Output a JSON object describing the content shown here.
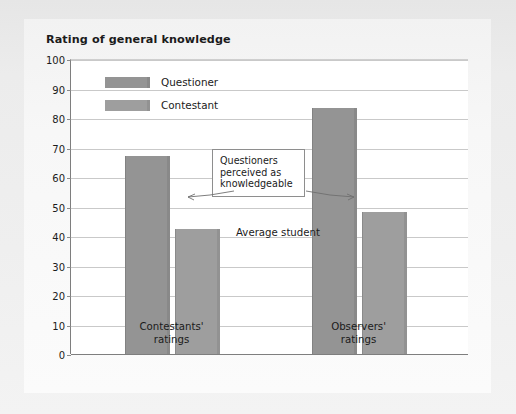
{
  "figure": {
    "title": "Rating of general knowledge",
    "annotation": "Questioners perceived as knowledgeable",
    "annotation_lines": [
      "Questioners",
      "perceived as",
      "knowledgeable"
    ],
    "average_student_label": "Average student",
    "background_color": "#e9e9e9",
    "plot_background_color": "#ffffff",
    "axis_color": "#7e7e7e",
    "gridline_color": "#c9c9c9"
  },
  "chart_data": {
    "type": "bar",
    "title": "Rating of general knowledge",
    "xlabel": "",
    "ylabel": "",
    "ylim": [
      0,
      100
    ],
    "yticks": [
      0,
      10,
      20,
      30,
      40,
      50,
      60,
      70,
      80,
      90,
      100
    ],
    "ytick_labels": [
      "0",
      "10",
      "20",
      "30",
      "40",
      "50",
      "60",
      "70",
      "80",
      "90",
      "100"
    ],
    "grid": true,
    "legend_position": "upper-left-inside",
    "categories": [
      "Contestants' ratings",
      "Observers' ratings"
    ],
    "category_lines": [
      [
        "Contestants'",
        "ratings"
      ],
      [
        "Observers'",
        "ratings"
      ]
    ],
    "series": [
      {
        "name": "Questioner",
        "color": "#949494",
        "values": [
          67,
          83.5
        ]
      },
      {
        "name": "Contestant",
        "color": "#9e9e9e",
        "values": [
          42.5,
          48
        ]
      }
    ],
    "annotations": [
      {
        "text": "Questioners perceived as knowledgeable",
        "points_to": [
          "Contestants' ratings / Questioner",
          "Observers' ratings / Questioner"
        ]
      },
      {
        "text": "Average student",
        "points_to": []
      }
    ]
  }
}
